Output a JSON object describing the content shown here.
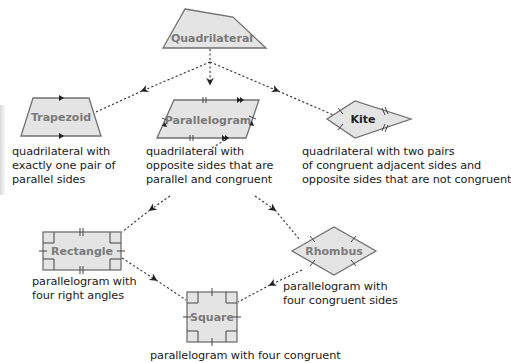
{
  "diagram": {
    "nodes": {
      "quadrilateral": {
        "label": "Quadrilateral"
      },
      "trapezoid": {
        "label": "Trapezoid",
        "desc": [
          "quadrilateral with",
          "exactly one pair of",
          "parallel sides"
        ]
      },
      "parallelogram": {
        "label": "Parallelogram",
        "desc": [
          "quadrilateral with",
          "opposite sides that are",
          "parallel and congruent"
        ]
      },
      "kite": {
        "label": "Kite",
        "desc": [
          "quadrilateral with two pairs",
          "of congruent adjacent sides and",
          "opposite sides that are not congruent"
        ]
      },
      "rectangle": {
        "label": "Rectangle",
        "desc": [
          "parallelogram with",
          "four right angles"
        ]
      },
      "rhombus": {
        "label": "Rhombus",
        "desc": [
          "parallelogram with",
          "four congruent sides"
        ]
      },
      "square": {
        "label": "Square",
        "desc": [
          "parallelogram with four congruent"
        ]
      }
    },
    "edges": [
      [
        "quadrilateral",
        "trapezoid"
      ],
      [
        "quadrilateral",
        "parallelogram"
      ],
      [
        "quadrilateral",
        "kite"
      ],
      [
        "parallelogram",
        "rectangle"
      ],
      [
        "parallelogram",
        "rhombus"
      ],
      [
        "rectangle",
        "square"
      ],
      [
        "rhombus",
        "square"
      ]
    ],
    "colors": {
      "shape_fill": "#e4e4e4",
      "shape_stroke": "#707070",
      "label_gray": "#7a7a7a",
      "label_dark": "#222222",
      "text": "#1a1a1a"
    }
  }
}
